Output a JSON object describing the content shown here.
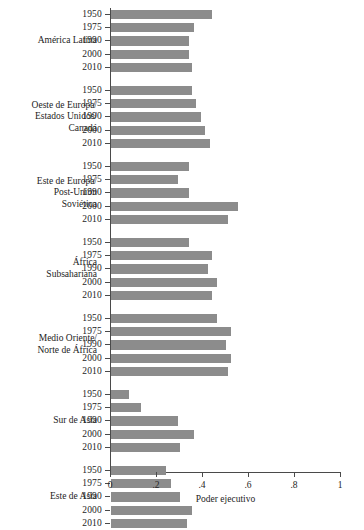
{
  "chart_data": {
    "type": "bar",
    "orientation": "horizontal",
    "title": "",
    "xlabel": "Poder ejecutivo",
    "ylabel": "",
    "xlim": [
      0,
      1
    ],
    "xticks": [
      0,
      0.2,
      0.4,
      0.6,
      0.8,
      1
    ],
    "xtick_labels": [
      "0",
      ".2",
      ".4",
      ".6",
      ".8",
      "1"
    ],
    "grid": false,
    "legend": false,
    "categories": [
      "1950",
      "1975",
      "1990",
      "2000",
      "2010"
    ],
    "groups": [
      {
        "name": "América Latina",
        "name_lines": [
          "América Latina"
        ],
        "values": [
          0.44,
          0.36,
          0.34,
          0.34,
          0.35
        ]
      },
      {
        "name": "Oeste de Europa/ Estados Unidos/ Canadá",
        "name_lines": [
          "Oeste de Europa/",
          "Estados Unidos/",
          "Canadá"
        ],
        "values": [
          0.35,
          0.37,
          0.39,
          0.41,
          0.43
        ]
      },
      {
        "name": "Este de Europa/ Post-Unión Soviética",
        "name_lines": [
          "Este de Europa/",
          "Post-Unión",
          "Soviética"
        ],
        "values": [
          0.34,
          0.29,
          0.34,
          0.55,
          0.51
        ]
      },
      {
        "name": "África Subsahariana",
        "name_lines": [
          "África",
          "Subsahariana"
        ],
        "values": [
          0.34,
          0.44,
          0.42,
          0.46,
          0.44
        ]
      },
      {
        "name": "Medio Oriente/ Norte de África",
        "name_lines": [
          "Medio Oriente/",
          "Norte de África"
        ],
        "values": [
          0.46,
          0.52,
          0.5,
          0.52,
          0.51
        ]
      },
      {
        "name": "Sur de Asia",
        "name_lines": [
          "Sur de Asia"
        ],
        "values": [
          0.08,
          0.13,
          0.29,
          0.36,
          0.3
        ]
      },
      {
        "name": "Este de Asia",
        "name_lines": [
          "Este de Asia"
        ],
        "values": [
          0.24,
          0.26,
          0.3,
          0.35,
          0.33
        ]
      }
    ],
    "colors": {
      "bar": "#8c8c8c",
      "axis": "#4a4a4a",
      "text": "#1c1c1c",
      "background": "#ffffff"
    }
  }
}
